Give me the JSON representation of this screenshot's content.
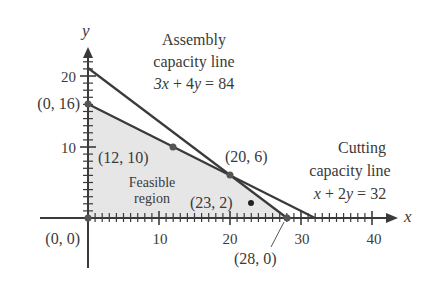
{
  "chart_data": {
    "type": "line",
    "title": "",
    "xlabel": "x",
    "ylabel": "y",
    "xlim": [
      0,
      42
    ],
    "ylim": [
      0,
      24
    ],
    "x_ticks": [
      10,
      20,
      30,
      40
    ],
    "x_tick_labels": [
      "10",
      "20",
      "30",
      "40"
    ],
    "y_ticks": [
      10,
      20
    ],
    "y_tick_labels": [
      "10",
      "20"
    ],
    "minor_tick_step": 1,
    "grid": false,
    "legend": null,
    "series": [
      {
        "name": "Assembly capacity line",
        "equation": "3x + 4y = 84",
        "x": [
          0,
          28
        ],
        "y": [
          21,
          0
        ]
      },
      {
        "name": "Cutting capacity line",
        "equation": "x + 2y = 32",
        "x": [
          0,
          32
        ],
        "y": [
          16,
          0
        ]
      }
    ],
    "feasible_region": {
      "label": "Feasible region",
      "vertices": [
        [
          0,
          0
        ],
        [
          0,
          16
        ],
        [
          20,
          6
        ],
        [
          28,
          0
        ]
      ]
    },
    "points": [
      {
        "label": "(0, 0)",
        "x": 0,
        "y": 0
      },
      {
        "label": "(0, 16)",
        "x": 0,
        "y": 16
      },
      {
        "label": "(12, 10)",
        "x": 12,
        "y": 10
      },
      {
        "label": "(20, 6)",
        "x": 20,
        "y": 6
      },
      {
        "label": "(23, 2)",
        "x": 23,
        "y": 2
      },
      {
        "label": "(28, 0)",
        "x": 28,
        "y": 0
      }
    ],
    "annotations": [
      {
        "text": "Assembly capacity line 3x + 4y = 84"
      },
      {
        "text": "Cutting capacity line x + 2y = 32"
      },
      {
        "text": "Feasible region"
      }
    ]
  },
  "labels": {
    "axis_x": "x",
    "axis_y": "y",
    "tick_x_10": "10",
    "tick_x_20": "20",
    "tick_x_30": "30",
    "tick_x_40": "40",
    "tick_y_10": "10",
    "tick_y_20": "20",
    "assembly_line1": "Assembly",
    "assembly_line2": "capacity line",
    "assembly_eq": "3x + 4y = 84",
    "cutting_line1": "Cutting",
    "cutting_line2": "capacity line",
    "cutting_eq": "x + 2y = 32",
    "feasible_line1": "Feasible",
    "feasible_line2": "region",
    "pt_0_0": "(0, 0)",
    "pt_0_16": "(0, 16)",
    "pt_12_10": "(12, 10)",
    "pt_20_6": "(20, 6)",
    "pt_23_2": "(23, 2)",
    "pt_28_0": "(28, 0)"
  },
  "colors": {
    "line": "#3a3a3a",
    "region_fill": "#e6e6e6",
    "text": "#3a3a3a"
  }
}
